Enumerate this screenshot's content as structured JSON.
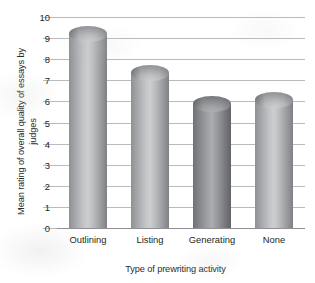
{
  "chart_data": {
    "type": "bar",
    "title": "",
    "subtitle": "",
    "xlabel": "Type of prewriting activity",
    "ylabel": "Mean rating of overall quality of essays by judges",
    "categories": [
      "Outlining",
      "Listing",
      "Generating",
      "None"
    ],
    "values": [
      9.2,
      7.35,
      5.9,
      6.05
    ],
    "series": [
      {
        "name": "Mean rating of overall quality of essays by judges",
        "values": [
          9.2,
          7.35,
          5.9,
          6.05
        ]
      }
    ],
    "ylim": [
      0,
      10
    ],
    "ytick_values": [
      0,
      1,
      2,
      3,
      4,
      5,
      6,
      7,
      8,
      9,
      10
    ],
    "ytick_labels": [
      "0",
      "1",
      "2",
      "3",
      "4",
      "5",
      "6",
      "7",
      "8",
      "9",
      "10"
    ],
    "grid": "horizontal-only",
    "legend": "none",
    "bar_style": "3d-cylinder",
    "colors": {
      "bar_light": "#c3c4c6",
      "bar_mid": "#9a9b9e",
      "bar_dark": "#7e7f82",
      "gridline": "#b9babc",
      "axis": "#8e8f92",
      "text": "#231f20",
      "background": "#ffffff"
    }
  }
}
